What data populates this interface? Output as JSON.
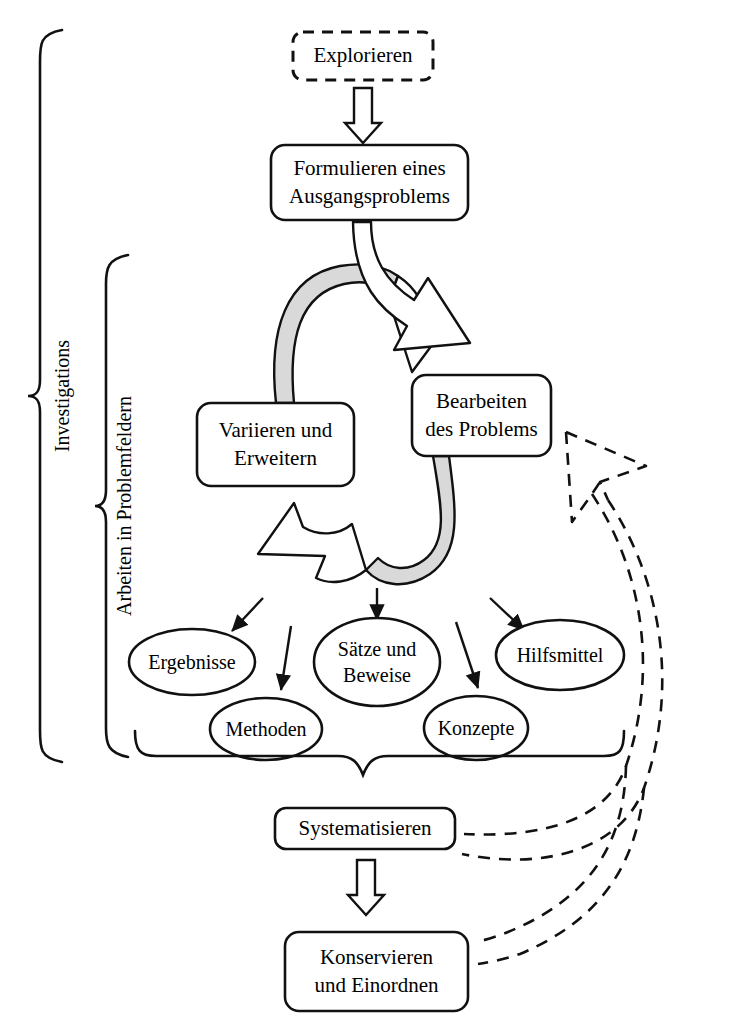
{
  "diagram": {
    "colors": {
      "stroke": "#111111",
      "ribbon_fill": "#d9d9d9",
      "background": "#ffffff",
      "text": "#000000"
    },
    "nodes": [
      {
        "id": "explorieren",
        "label": "Explorieren",
        "shape": "rounded-rect-dashed",
        "x": 293,
        "y": 32,
        "w": 140,
        "h": 48,
        "font_size": 21
      },
      {
        "id": "formulieren",
        "label": "Formulieren eines\nAusgangsproblems",
        "shape": "rounded-rect",
        "x": 271,
        "y": 145,
        "w": 197,
        "h": 75,
        "font_size": 21
      },
      {
        "id": "variieren",
        "label": "Variieren und\nErweitern",
        "shape": "rounded-rect",
        "x": 197,
        "y": 403,
        "w": 157,
        "h": 83,
        "font_size": 21
      },
      {
        "id": "bearbeiten",
        "label": "Bearbeiten\ndes Problems",
        "shape": "rounded-rect",
        "x": 412,
        "y": 375,
        "w": 139,
        "h": 81,
        "font_size": 21
      },
      {
        "id": "systematisieren",
        "label": "Systematisieren",
        "shape": "rounded-rect",
        "x": 275,
        "y": 808,
        "w": 180,
        "h": 41,
        "font_size": 21
      },
      {
        "id": "konservieren",
        "label": "Konservieren\nund Einordnen",
        "shape": "rounded-rect",
        "x": 285,
        "y": 932,
        "w": 183,
        "h": 79,
        "font_size": 21
      }
    ],
    "ellipses": [
      {
        "id": "ergebnisse",
        "label": "Ergebnisse",
        "cx": 192,
        "cy": 662,
        "rx": 63,
        "ry": 33,
        "font_size": 20
      },
      {
        "id": "methoden",
        "label": "Methoden",
        "cx": 266,
        "cy": 729,
        "rx": 56,
        "ry": 31,
        "font_size": 20
      },
      {
        "id": "saetze",
        "label": "Sätze und\nBeweise",
        "cx": 377,
        "cy": 662,
        "rx": 63,
        "ry": 44,
        "font_size": 20
      },
      {
        "id": "konzepte",
        "label": "Konzepte",
        "cx": 476,
        "cy": 728,
        "rx": 52,
        "ry": 32,
        "font_size": 20
      },
      {
        "id": "hilfsmittel",
        "label": "Hilfsmittel",
        "cx": 560,
        "cy": 655,
        "rx": 64,
        "ry": 35,
        "font_size": 20
      }
    ],
    "braces": [
      {
        "id": "investigations",
        "label": "Investigations",
        "x": 38,
        "y_top": 30,
        "y_bottom": 762,
        "font_size": 20,
        "label_x": 62,
        "label_y": 396
      },
      {
        "id": "problemfelder",
        "label": "Arbeiten in Problemfeldern",
        "x": 104,
        "y_top": 255,
        "y_bottom": 757,
        "font_size": 20,
        "label_x": 124,
        "label_y": 506
      }
    ],
    "block_arrows": [
      {
        "id": "explorieren-to-formulieren",
        "from": "explorieren",
        "to": "formulieren",
        "kind": "straight-down-hollow"
      },
      {
        "id": "formulieren-to-bearbeiten",
        "from": "formulieren",
        "to": "bearbeiten",
        "kind": "curved-hollow"
      },
      {
        "id": "cycle-to-bearbeiten",
        "from": "variieren",
        "to": "bearbeiten",
        "kind": "ribbon-cycle-right"
      },
      {
        "id": "cycle-to-variieren",
        "from": "bearbeiten",
        "to": "variieren",
        "kind": "ribbon-cycle-left"
      },
      {
        "id": "systematisieren-to-konservieren",
        "from": "systematisieren",
        "to": "konservieren",
        "kind": "straight-down-hollow"
      }
    ],
    "thin_arrows": [
      {
        "id": "to-ergebnisse",
        "target": "ergebnisse"
      },
      {
        "id": "to-methoden",
        "target": "methoden"
      },
      {
        "id": "to-saetze",
        "target": "saetze"
      },
      {
        "id": "to-konzepte",
        "target": "konzepte"
      },
      {
        "id": "to-hilfsmittel",
        "target": "hilfsmittel"
      }
    ],
    "dashed_feedback": [
      {
        "id": "systematisieren-feedback",
        "from": "systematisieren",
        "to": "bearbeiten",
        "style": "dashed-block-arrow"
      },
      {
        "id": "konservieren-feedback",
        "from": "konservieren",
        "to": "bearbeiten",
        "style": "dashed-block-arrow"
      }
    ],
    "gather_brace": {
      "id": "results-gather-brace",
      "left": 135,
      "right": 620,
      "y": 760,
      "tip_x": 365,
      "tip_y": 805
    }
  }
}
